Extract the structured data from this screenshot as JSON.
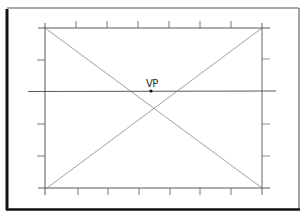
{
  "diagram": {
    "type": "one-point-perspective-grid",
    "vanishing_point": {
      "label": "VP",
      "x": 151,
      "y": 91
    },
    "colors": {
      "background": "#ffffff",
      "frame": "#1a1a1a",
      "lines": "#3a3a3a",
      "diagonals": "#6a6a6a",
      "ticks": "#555555"
    },
    "outer_frame": {
      "x1": 6,
      "y1": 8,
      "x2": 299,
      "y2": 210
    },
    "picture_plane": {
      "x1": 45,
      "y1": 28,
      "x2": 262,
      "y2": 188
    },
    "horizon_line": {
      "y": 91,
      "x1": 28,
      "x2": 276
    },
    "ticks": {
      "horizontal_positions": [
        45,
        76,
        107,
        138,
        169,
        200,
        231,
        262
      ],
      "vertical_positions": [
        28,
        60,
        91,
        124,
        156,
        188
      ]
    }
  }
}
